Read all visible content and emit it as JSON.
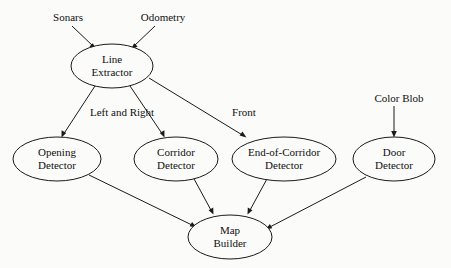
{
  "diagram": {
    "background_color": "#fbfbfa",
    "stroke_color": "#1a1a1a",
    "text_color": "#101010",
    "inputs": [
      {
        "id": "sonars",
        "label": "Sonars",
        "x": 68,
        "y": 18
      },
      {
        "id": "odometry",
        "label": "Odometry",
        "x": 163,
        "y": 18
      },
      {
        "id": "color-blob",
        "label": "Color Blob",
        "x": 399,
        "y": 99
      }
    ],
    "nodes": [
      {
        "id": "line-extractor",
        "line1": "Line",
        "line2": "Extractor",
        "cx": 112,
        "cy": 66,
        "rx": 41,
        "ry": 22
      },
      {
        "id": "opening-detector",
        "line1": "Opening",
        "line2": "Detector",
        "cx": 57,
        "cy": 159,
        "rx": 44,
        "ry": 22
      },
      {
        "id": "corridor-detector",
        "line1": "Corridor",
        "line2": "Detector",
        "cx": 176,
        "cy": 159,
        "rx": 42,
        "ry": 22
      },
      {
        "id": "end-of-corridor-detector",
        "line1": "End-of-Corridor",
        "line2": "Detector",
        "cx": 284,
        "cy": 159,
        "rx": 52,
        "ry": 22
      },
      {
        "id": "door-detector",
        "line1": "Door",
        "line2": "Detector",
        "cx": 394,
        "cy": 159,
        "rx": 41,
        "ry": 22
      },
      {
        "id": "map-builder",
        "line1": "Map",
        "line2": "Builder",
        "cx": 230,
        "cy": 237,
        "rx": 42,
        "ry": 22
      }
    ],
    "edges": [
      {
        "id": "sonars-to-line-extractor",
        "from": "sonars",
        "to": "line-extractor",
        "label": ""
      },
      {
        "id": "odometry-to-line-extractor",
        "from": "odometry",
        "to": "line-extractor",
        "label": ""
      },
      {
        "id": "line-extractor-to-opening-detector",
        "from": "line-extractor",
        "to": "opening-detector",
        "label": "Left and Right"
      },
      {
        "id": "line-extractor-to-corridor-detector",
        "from": "line-extractor",
        "to": "corridor-detector",
        "label": ""
      },
      {
        "id": "line-extractor-to-end-of-corridor-detector",
        "from": "line-extractor",
        "to": "end-of-corridor-detector",
        "label": "Front"
      },
      {
        "id": "color-blob-to-door-detector",
        "from": "color-blob",
        "to": "door-detector",
        "label": ""
      },
      {
        "id": "opening-detector-to-map-builder",
        "from": "opening-detector",
        "to": "map-builder",
        "label": ""
      },
      {
        "id": "corridor-detector-to-map-builder",
        "from": "corridor-detector",
        "to": "map-builder",
        "label": ""
      },
      {
        "id": "end-of-corridor-detector-to-map-builder",
        "from": "end-of-corridor-detector",
        "to": "map-builder",
        "label": ""
      },
      {
        "id": "door-detector-to-map-builder",
        "from": "door-detector",
        "to": "map-builder",
        "label": ""
      }
    ],
    "edge_labels": [
      {
        "id": "left-and-right-label",
        "text": "Left and Right",
        "x": 122,
        "y": 113
      },
      {
        "id": "front-label",
        "text": "Front",
        "x": 244,
        "y": 113
      }
    ]
  }
}
